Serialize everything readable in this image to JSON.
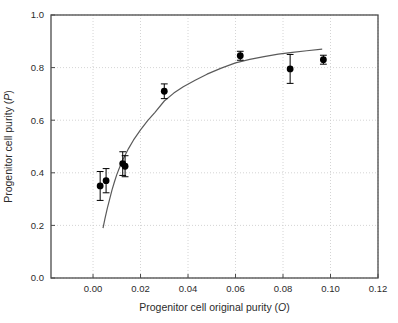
{
  "figure": {
    "background": "#ffffff",
    "axis_color": "#4a4a4a",
    "grid_color": "#c9c9c9",
    "point_color": "#000000",
    "curve_color": "#5a5a5a",
    "text_color": "#2b2b2b"
  },
  "chart_data": {
    "type": "scatter",
    "title": "",
    "xlabel": "Progenitor cell original purity (O)",
    "ylabel": "Progenitor cell purity (P)",
    "xlim": [
      -0.0177,
      0.12
    ],
    "ylim": [
      0.0,
      1.0
    ],
    "x_ticks": [
      0.0,
      0.02,
      0.04,
      0.06,
      0.08,
      0.1,
      0.12
    ],
    "x_tick_labels": [
      "0.00",
      "0.02",
      "0.04",
      "0.06",
      "0.08",
      "0.10",
      "0.12"
    ],
    "y_ticks": [
      0.0,
      0.2,
      0.4,
      0.6,
      0.8,
      1.0
    ],
    "y_tick_labels": [
      "0.0",
      "0.2",
      "0.4",
      "0.6",
      "0.8",
      "1.0"
    ],
    "grid": true,
    "legend": "none",
    "series": [
      {
        "name": "observed-points",
        "type": "scatter",
        "marker": "filled-circle",
        "points": [
          {
            "x": 0.003,
            "y": 0.35,
            "yerr": 0.055
          },
          {
            "x": 0.0055,
            "y": 0.37,
            "yerr": 0.046
          },
          {
            "x": 0.0125,
            "y": 0.435,
            "yerr": 0.045
          },
          {
            "x": 0.0135,
            "y": 0.425,
            "yerr": 0.04
          },
          {
            "x": 0.03,
            "y": 0.71,
            "yerr": 0.028
          },
          {
            "x": 0.062,
            "y": 0.845,
            "yerr": 0.017
          },
          {
            "x": 0.083,
            "y": 0.795,
            "yerr": 0.055
          },
          {
            "x": 0.097,
            "y": 0.83,
            "yerr": 0.017
          }
        ]
      },
      {
        "name": "fit-curve",
        "type": "line",
        "points": [
          [
            0.0042,
            0.19
          ],
          [
            0.005,
            0.225
          ],
          [
            0.006,
            0.265
          ],
          [
            0.007,
            0.3
          ],
          [
            0.008,
            0.335
          ],
          [
            0.009,
            0.365
          ],
          [
            0.01,
            0.393
          ],
          [
            0.0115,
            0.428
          ],
          [
            0.013,
            0.458
          ],
          [
            0.015,
            0.493
          ],
          [
            0.017,
            0.524
          ],
          [
            0.02,
            0.563
          ],
          [
            0.023,
            0.598
          ],
          [
            0.026,
            0.629
          ],
          [
            0.03,
            0.673
          ],
          [
            0.034,
            0.703
          ],
          [
            0.038,
            0.727
          ],
          [
            0.043,
            0.752
          ],
          [
            0.048,
            0.775
          ],
          [
            0.054,
            0.798
          ],
          [
            0.06,
            0.818
          ],
          [
            0.066,
            0.831
          ],
          [
            0.072,
            0.842
          ],
          [
            0.078,
            0.851
          ],
          [
            0.084,
            0.858
          ],
          [
            0.09,
            0.864
          ],
          [
            0.0965,
            0.87
          ]
        ]
      }
    ]
  }
}
